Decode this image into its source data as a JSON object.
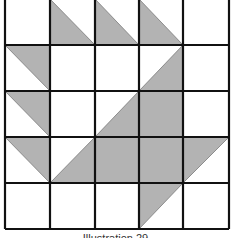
{
  "figure": {
    "caption": "Illustration 29",
    "rows": 5,
    "cols": 5,
    "fill_color": "#b3b3b3",
    "line_color": "#111111",
    "background": "#ffffff",
    "cells": [
      [
        "empty",
        "tri-bl",
        "tri-bl",
        "tri-bl",
        "empty"
      ],
      [
        "tri-tr",
        "empty",
        "empty",
        "tri-br",
        "empty"
      ],
      [
        "tri-tr",
        "empty",
        "tri-br",
        "full",
        "empty"
      ],
      [
        "tri-tr",
        "tri-br",
        "full",
        "full",
        "tri-tl"
      ],
      [
        "empty",
        "empty",
        "empty",
        "tri-tl",
        "empty"
      ]
    ]
  }
}
